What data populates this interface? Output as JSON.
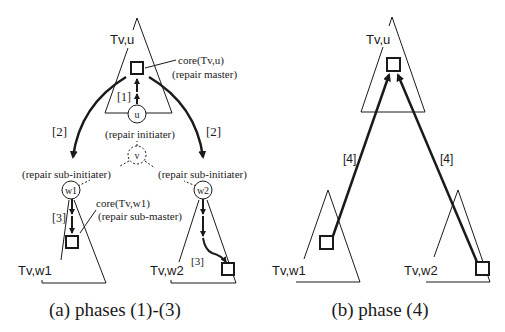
{
  "figure": {
    "panel_a": {
      "caption": "(a) phases (1)-(3)",
      "trees": {
        "root": {
          "label": "Tv,u"
        },
        "left": {
          "label": "Tv,w1"
        },
        "right": {
          "label": "Tv,w2"
        }
      },
      "nodes": {
        "u": "u",
        "v": "v",
        "w1": "w1",
        "w2": "w2"
      },
      "annotations": {
        "core_root": "core(Tv,u)",
        "core_root_role": "(repair master)",
        "u_role": "(repair initiater)",
        "w1_role": "(repair sub-initiater)",
        "w2_role": "(repair sub-initiater)",
        "core_w1": "core(Tv,w1)",
        "core_w1_role": "(repair sub-master)"
      },
      "phase_labels": {
        "phase1": "[1]",
        "phase2_left": "[2]",
        "phase2_right": "[2]",
        "phase3_left": "[3]",
        "phase3_right": "[3]"
      }
    },
    "panel_b": {
      "caption": "(b) phase (4)",
      "trees": {
        "root": {
          "label": "Tv,u"
        },
        "left": {
          "label": "Tv,w1"
        },
        "right": {
          "label": "Tv,w2"
        }
      },
      "phase_labels": {
        "phase4_left": "[4]",
        "phase4_right": "[4]"
      }
    },
    "colors": {
      "ink": "#1a1a1a",
      "background": "#ffffff"
    }
  }
}
